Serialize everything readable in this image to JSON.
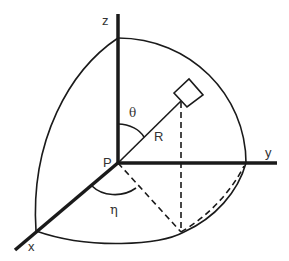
{
  "diagram": {
    "type": "3d-spherical-coordinates",
    "labels": {
      "z_axis": "z",
      "y_axis": "y",
      "x_axis": "x",
      "origin": "P",
      "polar_angle": "θ",
      "azimuth_angle": "η",
      "radius": "R"
    },
    "colors": {
      "stroke": "#1a1a1a",
      "text": "#333333",
      "background": "#ffffff"
    }
  }
}
